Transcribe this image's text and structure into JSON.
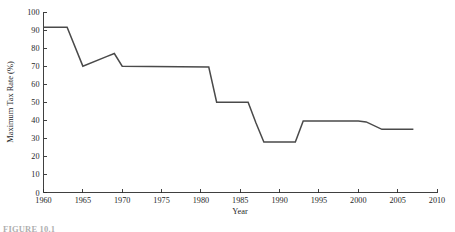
{
  "figure": {
    "caption": "FIGURE 10.1",
    "background_color": "#ffffff",
    "line_color": "#4a4a4a",
    "axis_color": "#2b2b2b"
  },
  "chart_data": {
    "type": "line",
    "title": "",
    "subtitle": "",
    "xlabel": "Year",
    "ylabel": "Maximum Tax Rate (%)",
    "xlim": [
      1960,
      2010
    ],
    "ylim": [
      0,
      100
    ],
    "grid": false,
    "legend": "none",
    "xticks": [
      1960,
      1965,
      1970,
      1975,
      1980,
      1985,
      1990,
      1995,
      2000,
      2005,
      2010
    ],
    "xtick_labels": [
      "1960",
      "1965",
      "1970",
      "1975",
      "1980",
      "1985",
      "1990",
      "1995",
      "2000",
      "2005",
      "2010"
    ],
    "yticks": [
      0,
      10,
      20,
      30,
      40,
      50,
      60,
      70,
      80,
      90,
      100
    ],
    "ytick_labels": [
      "0",
      "10",
      "20",
      "30",
      "40",
      "50",
      "60",
      "70",
      "80",
      "90",
      "100"
    ],
    "series": [
      {
        "name": "Maximum Tax Rate",
        "color": "#4a4a4a",
        "x": [
          1960,
          1963,
          1965,
          1968,
          1969,
          1970,
          1981,
          1982,
          1986,
          1987,
          1988,
          1992,
          1993,
          2000,
          2001,
          2003,
          2007
        ],
        "values": [
          91.5,
          91.5,
          70,
          75.3,
          77,
          70,
          69.5,
          50,
          50,
          38.5,
          28,
          28,
          39.6,
          39.6,
          39.1,
          35,
          35
        ]
      }
    ]
  }
}
